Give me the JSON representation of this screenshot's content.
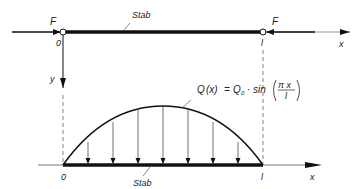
{
  "diagram": {
    "top": {
      "force_left_label": "F",
      "force_right_label": "F",
      "origin_label": "0",
      "end_label": "l",
      "bar_label": "Stab",
      "x_axis_label": "x",
      "y_axis_label": "y"
    },
    "bottom": {
      "formula_Q": "Q",
      "formula_x": "(x)",
      "formula_eq": "=",
      "formula_Q0": "Q",
      "formula_sub0": "0",
      "formula_dot": "·",
      "formula_sin": "sin",
      "formula_num": "π x",
      "formula_den": "l",
      "origin_label": "0",
      "end_label": "l",
      "bar_label": "Stab",
      "x_axis_label": "x"
    },
    "colors": {
      "line": "#111111",
      "dashed": "#666666"
    }
  }
}
